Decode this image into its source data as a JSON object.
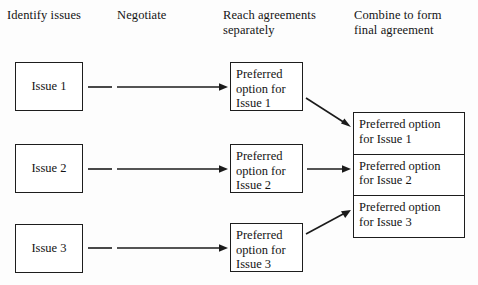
{
  "diagram": {
    "background_color": "#fdfdfd",
    "line_color": "#1b1b1b",
    "text_color": "#141414"
  },
  "headings": [
    {
      "id": "identify",
      "label": "Identify issues"
    },
    {
      "id": "negotiate",
      "label": "Negotiate"
    },
    {
      "id": "reach",
      "label": "Reach agreements\nseparately"
    },
    {
      "id": "combine",
      "label": "Combine to form\nfinal agreement"
    }
  ],
  "issue_boxes": [
    {
      "id": "issue-1",
      "label": "Issue 1"
    },
    {
      "id": "issue-2",
      "label": "Issue 2"
    },
    {
      "id": "issue-3",
      "label": "Issue 3"
    }
  ],
  "preferred_boxes": [
    {
      "id": "pref-1",
      "label": "Preferred\noption for\nIssue 1"
    },
    {
      "id": "pref-2",
      "label": "Preferred\noption for\nIssue 2"
    },
    {
      "id": "pref-3",
      "label": "Preferred\noption for\nIssue 3"
    }
  ],
  "combined_box": {
    "cells": [
      {
        "id": "combined-1",
        "label": "Preferred option\nfor Issue 1"
      },
      {
        "id": "combined-2",
        "label": "Preferred option\nfor Issue 2"
      },
      {
        "id": "combined-3",
        "label": "Preferred option\nfor Issue 3"
      }
    ]
  },
  "connectors": [
    {
      "id": "issue-1-to-pref-1",
      "style": "solid",
      "direction": "right"
    },
    {
      "id": "issue-2-to-pref-2",
      "style": "solid",
      "direction": "right"
    },
    {
      "id": "issue-3-to-pref-3",
      "style": "solid",
      "direction": "right"
    },
    {
      "id": "pref-1-to-combined",
      "style": "solid",
      "direction": "down-right"
    },
    {
      "id": "pref-2-to-combined",
      "style": "solid",
      "direction": "right"
    },
    {
      "id": "pref-3-to-combined",
      "style": "solid",
      "direction": "up-right"
    }
  ]
}
